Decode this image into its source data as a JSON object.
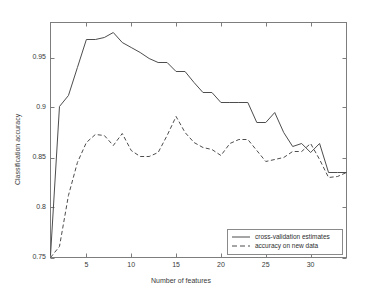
{
  "chart_data": {
    "type": "line",
    "title": "",
    "xlabel": "Number of features",
    "ylabel": "Classification accuracy",
    "xlim": [
      1,
      34
    ],
    "ylim": [
      0.75,
      0.985
    ],
    "xticks": [
      5,
      10,
      15,
      20,
      25,
      30
    ],
    "xtick_labels": [
      "5",
      "10",
      "15",
      "20",
      "25",
      "30"
    ],
    "yticks": [
      0.75,
      0.8,
      0.85,
      0.9,
      0.95
    ],
    "ytick_labels": [
      "0.75",
      "0.8",
      "0.85",
      "0.9",
      "0.95"
    ],
    "grid": false,
    "legend_position": "lower right",
    "x": [
      1,
      2,
      3,
      4,
      5,
      6,
      7,
      8,
      9,
      10,
      11,
      12,
      13,
      14,
      15,
      16,
      17,
      18,
      19,
      20,
      21,
      22,
      23,
      24,
      25,
      26,
      27,
      28,
      29,
      30,
      31,
      32,
      33,
      34
    ],
    "series": [
      {
        "name": "cross-validation estimates",
        "style": "solid",
        "color": "#4d4d4d",
        "values": [
          0.752,
          0.901,
          0.912,
          0.94,
          0.968,
          0.968,
          0.97,
          0.975,
          0.965,
          0.96,
          0.955,
          0.949,
          0.945,
          0.945,
          0.936,
          0.936,
          0.925,
          0.915,
          0.915,
          0.905,
          0.905,
          0.905,
          0.905,
          0.885,
          0.885,
          0.895,
          0.875,
          0.861,
          0.864,
          0.855,
          0.864,
          0.835,
          0.835,
          0.835
        ]
      },
      {
        "name": "accuracy on new data",
        "style": "dashed",
        "color": "#4d4d4d",
        "values": [
          0.75,
          0.761,
          0.812,
          0.845,
          0.865,
          0.873,
          0.872,
          0.862,
          0.874,
          0.857,
          0.851,
          0.851,
          0.855,
          0.872,
          0.891,
          0.875,
          0.865,
          0.86,
          0.858,
          0.852,
          0.864,
          0.868,
          0.868,
          0.857,
          0.846,
          0.848,
          0.85,
          0.856,
          0.856,
          0.864,
          0.848,
          0.83,
          0.831,
          0.835
        ]
      }
    ]
  },
  "legend": {
    "entries": [
      {
        "label": "cross-validation estimates",
        "style": "solid"
      },
      {
        "label": "accuracy on new data",
        "style": "dashed"
      }
    ]
  },
  "axes": {
    "x_title": "Number of features",
    "y_title": "Classification accuracy"
  }
}
